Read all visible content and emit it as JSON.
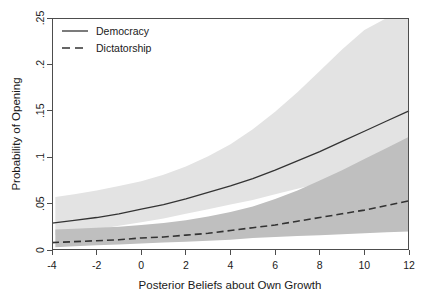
{
  "figure": {
    "background_color": "#ffffff",
    "frame_color": "#4d4d4d"
  },
  "legend": {
    "position": "top-left-inside",
    "entries": [
      {
        "label": "Democracy",
        "style": "solid",
        "color": "#333333"
      },
      {
        "label": "Dictatorship",
        "style": "dashed",
        "color": "#333333"
      }
    ]
  },
  "chart_data": {
    "type": "line",
    "title": "",
    "subtitle": "",
    "xlabel": "Posterior Beliefs about Own Growth",
    "ylabel": "Probability of Opening",
    "xlim": [
      -4,
      12
    ],
    "ylim": [
      0,
      0.25
    ],
    "grid": false,
    "xticks": [
      -4,
      -2,
      0,
      2,
      4,
      6,
      8,
      10,
      12
    ],
    "xtick_labels": [
      "-4",
      "-2",
      "0",
      "2",
      "4",
      "6",
      "8",
      "10",
      "12"
    ],
    "yticks": [
      0,
      0.05,
      0.1,
      0.15,
      0.2,
      0.25
    ],
    "ytick_labels": [
      "0",
      ".05",
      ".1",
      ".15",
      ".2",
      ".25"
    ],
    "legend_position": "upper left",
    "x": [
      -4,
      -3,
      -2,
      -1,
      0,
      1,
      2,
      3,
      4,
      5,
      6,
      7,
      8,
      9,
      10,
      11,
      12
    ],
    "series": [
      {
        "name": "Democracy",
        "style": "solid",
        "line_color": "#333333",
        "band_color": "#e3e3e3",
        "values": [
          0.029,
          0.032,
          0.035,
          0.039,
          0.044,
          0.049,
          0.055,
          0.062,
          0.069,
          0.077,
          0.086,
          0.096,
          0.106,
          0.117,
          0.128,
          0.139,
          0.15
        ],
        "ci_lower": [
          0.016,
          0.019,
          0.022,
          0.026,
          0.03,
          0.034,
          0.039,
          0.044,
          0.049,
          0.054,
          0.06,
          0.066,
          0.072,
          0.078,
          0.084,
          0.09,
          0.096
        ],
        "ci_upper": [
          0.057,
          0.06,
          0.064,
          0.069,
          0.074,
          0.081,
          0.09,
          0.101,
          0.114,
          0.13,
          0.149,
          0.17,
          0.193,
          0.216,
          0.237,
          0.25,
          0.25
        ]
      },
      {
        "name": "Dictatorship",
        "style": "dashed",
        "line_color": "#333333",
        "band_color": "#bfbfbf",
        "values": [
          0.008,
          0.009,
          0.01,
          0.011,
          0.013,
          0.014,
          0.016,
          0.018,
          0.021,
          0.024,
          0.027,
          0.031,
          0.035,
          0.039,
          0.043,
          0.048,
          0.053
        ],
        "ci_lower": [
          0.003,
          0.004,
          0.005,
          0.006,
          0.007,
          0.008,
          0.009,
          0.01,
          0.011,
          0.013,
          0.014,
          0.015,
          0.016,
          0.017,
          0.018,
          0.019,
          0.02
        ],
        "ci_upper": [
          0.022,
          0.023,
          0.024,
          0.025,
          0.027,
          0.029,
          0.032,
          0.036,
          0.041,
          0.047,
          0.055,
          0.064,
          0.075,
          0.086,
          0.098,
          0.11,
          0.122
        ]
      }
    ]
  }
}
